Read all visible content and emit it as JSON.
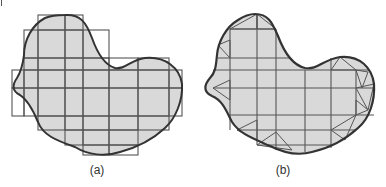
{
  "figure": {
    "panels": [
      {
        "id": "a",
        "label": "(a)",
        "description": "Irregular region overlaid with axis-aligned grid cells covering the boundary",
        "shape_fill": "#d9d9d9",
        "outline_color": "#333333",
        "grid_color": "#555555",
        "outline_path": "M 65 15 C 80 14, 86 22, 92 38 C 98 55, 105 65, 115 68 C 125 70, 130 60, 145 58 C 165 56, 180 68, 182 84 C 183 100, 176 118, 165 128 C 150 142, 135 148, 120 152 C 105 157, 88 155, 75 147 C 55 140, 43 135, 38 122 C 33 110, 28 100, 20 95 C 12 91, 12 85, 17 78 C 22 70, 23 63, 24 55 C 24 40, 32 25, 45 18 C 52 15, 58 15, 65 15 Z",
        "cells": [
          [
            38,
            15,
            27,
            15
          ],
          [
            65,
            15,
            18,
            15
          ],
          [
            24,
            30,
            14,
            28
          ],
          [
            38,
            30,
            27,
            28
          ],
          [
            65,
            30,
            18,
            28
          ],
          [
            83,
            30,
            26,
            28
          ],
          [
            24,
            58,
            14,
            12
          ],
          [
            38,
            58,
            27,
            12
          ],
          [
            65,
            58,
            18,
            12
          ],
          [
            83,
            58,
            26,
            12
          ],
          [
            109,
            58,
            29,
            12
          ],
          [
            138,
            58,
            31,
            12
          ],
          [
            12,
            70,
            12,
            18
          ],
          [
            24,
            70,
            14,
            18
          ],
          [
            38,
            70,
            27,
            18
          ],
          [
            65,
            70,
            18,
            18
          ],
          [
            83,
            70,
            26,
            18
          ],
          [
            109,
            70,
            29,
            18
          ],
          [
            138,
            70,
            31,
            18
          ],
          [
            169,
            70,
            13,
            18
          ],
          [
            12,
            88,
            12,
            28
          ],
          [
            24,
            88,
            14,
            28
          ],
          [
            38,
            88,
            27,
            28
          ],
          [
            65,
            88,
            18,
            28
          ],
          [
            83,
            88,
            26,
            28
          ],
          [
            109,
            88,
            29,
            28
          ],
          [
            138,
            88,
            31,
            28
          ],
          [
            169,
            88,
            13,
            28
          ],
          [
            38,
            116,
            27,
            14
          ],
          [
            65,
            116,
            18,
            14
          ],
          [
            83,
            116,
            26,
            14
          ],
          [
            109,
            116,
            29,
            14
          ],
          [
            138,
            116,
            31,
            14
          ],
          [
            65,
            130,
            18,
            15
          ],
          [
            83,
            130,
            26,
            15
          ],
          [
            109,
            130,
            29,
            15
          ],
          [
            83,
            145,
            26,
            10
          ],
          [
            109,
            145,
            29,
            10
          ]
        ]
      },
      {
        "id": "b",
        "label": "(b)",
        "description": "Adapted mesh: interior grid cells with boundary cells triangulated to fit the curved outline",
        "shape_fill": "#d9d9d9",
        "outline_color": "#333333",
        "grid_color": "#555555",
        "outline_path": "M 255 14 C 268 14, 272 22, 278 36 C 284 52, 292 65, 305 68 C 318 70, 322 60, 340 57 C 360 55, 372 68, 374 84 C 375 100, 370 118, 358 128 C 345 140, 330 148, 312 152 C 298 156, 282 152, 270 146 C 252 138, 240 134, 232 122 C 226 110, 222 100, 212 96 C 203 92, 204 85, 210 78 C 216 72, 216 64, 217 55 C 218 42, 226 27, 238 20 C 244 16, 250 14, 255 14 Z",
        "grid_lines": {
          "vertical": [
            [
              230,
              29,
              230,
              130
            ],
            [
              257,
              14,
              257,
              145
            ],
            [
              276,
              29,
              276,
              150
            ],
            [
              305,
              70,
              305,
              152
            ],
            [
              331,
              58,
              331,
              148
            ],
            [
              356,
              70,
              356,
              115
            ]
          ],
          "horizontal": [
            [
              230,
              29,
              276,
              29
            ],
            [
              218,
              58,
              290,
              58
            ],
            [
              213,
              70,
              368,
              70
            ],
            [
              213,
              88,
              374,
              88
            ],
            [
              230,
              115,
              374,
              115
            ],
            [
              237,
              130,
              356,
              130
            ],
            [
              257,
              145,
              331,
              145
            ]
          ]
        },
        "triangles": [
          [
            [
              230,
              29
            ],
            [
              257,
              14
            ],
            [
              257,
              29
            ]
          ],
          [
            [
              257,
              14
            ],
            [
              276,
              29
            ],
            [
              257,
              29
            ]
          ],
          [
            [
              218,
              45
            ],
            [
              230,
              58
            ],
            [
              230,
              40
            ]
          ],
          [
            [
              213,
              88
            ],
            [
              230,
              80
            ],
            [
              230,
              100
            ]
          ],
          [
            [
              356,
              70
            ],
            [
              368,
              72
            ],
            [
              362,
              88
            ]
          ],
          [
            [
              356,
              88
            ],
            [
              374,
              84
            ],
            [
              368,
              110
            ]
          ],
          [
            [
              356,
              115
            ],
            [
              368,
              110
            ],
            [
              356,
              100
            ]
          ],
          [
            [
              237,
              130
            ],
            [
              257,
              120
            ],
            [
              257,
              140
            ]
          ],
          [
            [
              257,
              145
            ],
            [
              276,
              132
            ],
            [
              292,
              150
            ]
          ],
          [
            [
              331,
              130
            ],
            [
              356,
              115
            ],
            [
              345,
              140
            ]
          ],
          [
            [
              340,
              57
            ],
            [
              331,
              70
            ],
            [
              356,
              70
            ]
          ]
        ]
      }
    ]
  },
  "labels": {
    "a": "(a)",
    "b": "(b)"
  }
}
